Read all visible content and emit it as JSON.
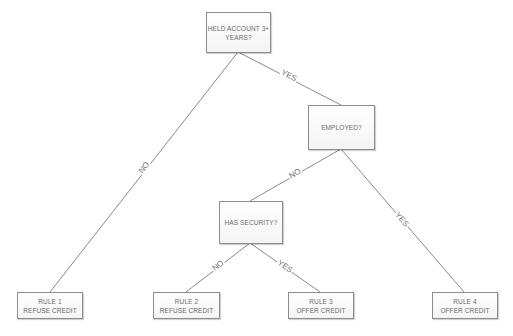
{
  "diagram": {
    "type": "decision-tree",
    "line_color": "#8a8a8a",
    "node_border_color": "#8c8c8c",
    "text_color": "#6a6a6a",
    "nodes": {
      "root": {
        "label": "HELD ACCOUNT 3+\nYEARS?"
      },
      "employed": {
        "label": "EMPLOYED?"
      },
      "security": {
        "label": "HAS SECURITY?"
      },
      "rule1": {
        "label": "RULE 1\nREFUSE CREDIT"
      },
      "rule2": {
        "label": "RULE 2\nREFUSE CREDIT"
      },
      "rule3": {
        "label": "RULE 3\nOFFER CREDIT"
      },
      "rule4": {
        "label": "RULE 4\nOFFER CREDIT"
      }
    },
    "edges": [
      {
        "from": "root",
        "to": "rule1",
        "label": "NO"
      },
      {
        "from": "root",
        "to": "employed",
        "label": "YES"
      },
      {
        "from": "employed",
        "to": "security",
        "label": "NO"
      },
      {
        "from": "employed",
        "to": "rule4",
        "label": "YES"
      },
      {
        "from": "security",
        "to": "rule2",
        "label": "NO"
      },
      {
        "from": "security",
        "to": "rule3",
        "label": "YES"
      }
    ]
  }
}
